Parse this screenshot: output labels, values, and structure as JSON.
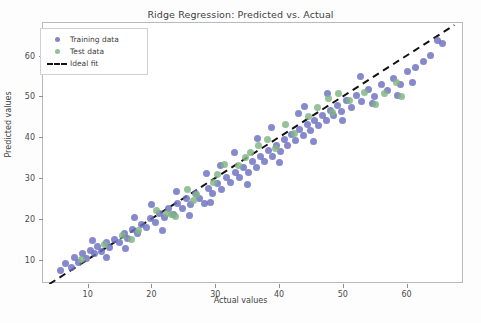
{
  "chart_data": {
    "type": "scatter",
    "title": "Ridge Regression: Predicted vs. Actual",
    "xlabel": "Actual values",
    "ylabel": "Predicted values",
    "xlim": [
      3.0,
      69.0
    ],
    "ylim": [
      4.0,
      68.0
    ],
    "xticks": [
      10,
      20,
      30,
      40,
      50,
      60
    ],
    "yticks": [
      10,
      20,
      30,
      40,
      50,
      60
    ],
    "grid": false,
    "legend_position": "upper left",
    "colors": {
      "training": "#6b6fc0",
      "test": "#80b482",
      "ideal_fit": "#111111",
      "frame": "#b9b9bd",
      "background": "#ffffff"
    },
    "series": [
      {
        "name": "Training data",
        "type": "scatter",
        "color": "#6b6fc0",
        "points": [
          [
            5.8,
            7.2
          ],
          [
            6.6,
            9.0
          ],
          [
            7.4,
            8.1
          ],
          [
            8.0,
            10.4
          ],
          [
            8.6,
            9.3
          ],
          [
            9.2,
            11.6
          ],
          [
            9.8,
            10.2
          ],
          [
            10.4,
            12.3
          ],
          [
            11.0,
            11.4
          ],
          [
            11.6,
            13.1
          ],
          [
            12.2,
            12.0
          ],
          [
            12.9,
            14.2
          ],
          [
            13.5,
            13.0
          ],
          [
            14.2,
            15.0
          ],
          [
            15.0,
            14.3
          ],
          [
            15.7,
            16.4
          ],
          [
            16.3,
            15.2
          ],
          [
            17.0,
            17.3
          ],
          [
            17.8,
            16.5
          ],
          [
            18.5,
            18.6
          ],
          [
            19.2,
            17.8
          ],
          [
            19.9,
            20.0
          ],
          [
            20.6,
            19.0
          ],
          [
            21.3,
            21.4
          ],
          [
            22.0,
            20.3
          ],
          [
            22.7,
            22.6
          ],
          [
            23.4,
            21.0
          ],
          [
            24.1,
            23.8
          ],
          [
            24.8,
            22.4
          ],
          [
            25.5,
            25.0
          ],
          [
            26.2,
            23.6
          ],
          [
            26.9,
            26.2
          ],
          [
            27.6,
            25.0
          ],
          [
            28.3,
            23.8
          ],
          [
            28.9,
            27.4
          ],
          [
            29.6,
            26.3
          ],
          [
            30.3,
            28.6
          ],
          [
            31.0,
            27.2
          ],
          [
            31.7,
            30.0
          ],
          [
            32.4,
            28.8
          ],
          [
            33.1,
            31.4
          ],
          [
            33.8,
            30.2
          ],
          [
            34.5,
            32.6
          ],
          [
            35.2,
            31.3
          ],
          [
            35.9,
            34.0
          ],
          [
            36.4,
            32.6
          ],
          [
            37.1,
            35.3
          ],
          [
            37.8,
            34.0
          ],
          [
            38.4,
            36.8
          ],
          [
            39.0,
            35.2
          ],
          [
            39.6,
            38.0
          ],
          [
            40.2,
            36.4
          ],
          [
            40.8,
            39.4
          ],
          [
            41.4,
            38.0
          ],
          [
            42.0,
            40.6
          ],
          [
            42.6,
            39.2
          ],
          [
            43.2,
            41.8
          ],
          [
            43.8,
            40.4
          ],
          [
            44.4,
            43.0
          ],
          [
            45.0,
            41.6
          ],
          [
            45.6,
            44.2
          ],
          [
            46.2,
            42.8
          ],
          [
            46.8,
            45.4
          ],
          [
            47.4,
            44.0
          ],
          [
            48.0,
            46.6
          ],
          [
            48.6,
            45.2
          ],
          [
            49.2,
            47.8
          ],
          [
            49.8,
            46.2
          ],
          [
            50.6,
            49.0
          ],
          [
            51.4,
            47.4
          ],
          [
            52.2,
            50.2
          ],
          [
            53.0,
            48.8
          ],
          [
            54.0,
            51.6
          ],
          [
            55.0,
            50.0
          ],
          [
            56.0,
            53.0
          ],
          [
            57.0,
            51.4
          ],
          [
            58.0,
            54.4
          ],
          [
            59.0,
            53.0
          ],
          [
            60.2,
            56.0
          ],
          [
            61.4,
            57.2
          ],
          [
            62.6,
            58.6
          ],
          [
            63.8,
            60.0
          ],
          [
            64.8,
            63.8
          ],
          [
            65.6,
            63.0
          ],
          [
            24.0,
            26.8
          ],
          [
            28.6,
            31.2
          ],
          [
            33.0,
            36.2
          ],
          [
            38.8,
            42.4
          ],
          [
            44.0,
            47.6
          ],
          [
            47.6,
            50.8
          ],
          [
            52.8,
            55.0
          ],
          [
            35.0,
            28.4
          ],
          [
            40.0,
            33.8
          ],
          [
            45.4,
            39.0
          ],
          [
            20.0,
            23.6
          ],
          [
            26.0,
            20.8
          ],
          [
            30.8,
            33.0
          ],
          [
            36.6,
            39.6
          ],
          [
            43.0,
            45.8
          ],
          [
            13.0,
            10.6
          ],
          [
            17.4,
            20.2
          ],
          [
            21.8,
            17.2
          ],
          [
            29.2,
            24.0
          ],
          [
            50.0,
            44.0
          ],
          [
            54.6,
            48.2
          ],
          [
            58.6,
            50.2
          ],
          [
            61.0,
            53.4
          ],
          [
            10.8,
            14.6
          ],
          [
            16.0,
            12.6
          ]
        ]
      },
      {
        "name": "Test data",
        "type": "scatter",
        "color": "#80b482",
        "points": [
          [
            9.0,
            10.0
          ],
          [
            12.6,
            13.6
          ],
          [
            15.4,
            16.0
          ],
          [
            18.0,
            17.2
          ],
          [
            20.8,
            22.0
          ],
          [
            23.2,
            21.0
          ],
          [
            23.8,
            20.6
          ],
          [
            25.6,
            27.2
          ],
          [
            27.0,
            26.0
          ],
          [
            29.8,
            29.0
          ],
          [
            31.4,
            33.4
          ],
          [
            33.6,
            33.0
          ],
          [
            34.8,
            35.0
          ],
          [
            35.6,
            36.2
          ],
          [
            36.8,
            38.0
          ],
          [
            38.2,
            39.4
          ],
          [
            39.4,
            37.2
          ],
          [
            41.0,
            43.0
          ],
          [
            42.4,
            41.0
          ],
          [
            44.6,
            45.0
          ],
          [
            46.0,
            47.4
          ],
          [
            47.8,
            49.4
          ],
          [
            49.4,
            50.8
          ],
          [
            51.0,
            49.0
          ],
          [
            53.4,
            51.0
          ],
          [
            55.2,
            48.0
          ],
          [
            56.6,
            50.6
          ],
          [
            58.4,
            53.4
          ],
          [
            59.2,
            50.0
          ],
          [
            30.4,
            30.8
          ],
          [
            22.4,
            21.2
          ],
          [
            48.4,
            46.0
          ],
          [
            26.6,
            24.4
          ],
          [
            16.8,
            15.0
          ]
        ]
      }
    ],
    "ideal_fit": {
      "name": "Ideal fit",
      "style": "dashed",
      "color": "#111111",
      "from": [
        4.0,
        4.0
      ],
      "to": [
        67.5,
        67.5
      ]
    }
  },
  "legend": {
    "items": [
      {
        "label": "Training data",
        "marker": "dot",
        "color": "#6b6fc0"
      },
      {
        "label": "Test data",
        "marker": "dot",
        "color": "#80b482"
      },
      {
        "label": "Ideal fit",
        "marker": "dashed-line",
        "color": "#111111"
      }
    ]
  }
}
